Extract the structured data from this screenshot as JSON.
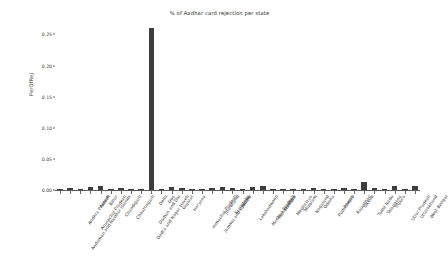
{
  "chart_data": {
    "type": "bar",
    "title": "% of Aadhar card rejection per state",
    "xlabel": "",
    "ylabel": "PerOfRej",
    "ylim": [
      0,
      0.27
    ],
    "yticks": [
      "0.00",
      "0.05",
      "0.10",
      "0.15",
      "0.20",
      "0.25"
    ],
    "ytick_values": [
      0.0,
      0.05,
      0.1,
      0.15,
      0.2,
      0.25
    ],
    "grid": false,
    "legend": "none",
    "bar_color": "#3d3d3d",
    "categories": [
      "Andaman and Nicobar Islands",
      "Andhra Pradesh",
      "Arunachal Pradesh",
      "Assam",
      "Bihar",
      "Chandigarh",
      "Chhattisgarh",
      "Dadra and Nagar Haveli",
      "Daman and Diu",
      "Delhi",
      "Goa",
      "Gujarat",
      "Haryana",
      "Himachal Pradesh",
      "Jammu and Kashmir",
      "Jharkhand",
      "Karnataka",
      "Kerala",
      "Lakshadweep",
      "Madhya Pradesh",
      "Maharashtra",
      "Manipur",
      "Meghalaya",
      "Mizoram",
      "Nagaland",
      "Odisha",
      "Puducherry",
      "Punjab",
      "Rajasthan",
      "Sikkim",
      "Tamil Nadu",
      "Telangana",
      "Tripura",
      "Uttar Pradesh",
      "Uttarakhand",
      "West Bengal"
    ],
    "values": [
      0.0004,
      0.0035,
      0.0006,
      0.0042,
      0.0058,
      0.0008,
      0.0038,
      0.0004,
      0.0003,
      0.2605,
      0.0004,
      0.0052,
      0.003,
      0.0012,
      0.0016,
      0.003,
      0.005,
      0.003,
      0.0003,
      0.0048,
      0.0062,
      0.0008,
      0.0008,
      0.0006,
      0.0006,
      0.003,
      0.0005,
      0.0022,
      0.004,
      0.0004,
      0.0125,
      0.0035,
      0.0006,
      0.0072,
      0.0014,
      0.0058
    ]
  }
}
